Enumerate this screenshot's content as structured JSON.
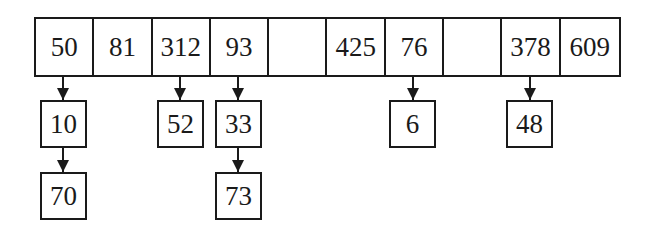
{
  "diagram": {
    "type": "hash-table-separate-chaining",
    "array": [
      "50",
      "81",
      "312",
      "93",
      "",
      "425",
      "76",
      "",
      "378",
      "609"
    ],
    "chains": [
      {
        "slot": 0,
        "nodes": [
          "10",
          "70"
        ]
      },
      {
        "slot": 2,
        "nodes": [
          "52"
        ]
      },
      {
        "slot": 3,
        "nodes": [
          "33",
          "73"
        ]
      },
      {
        "slot": 6,
        "nodes": [
          "6"
        ]
      },
      {
        "slot": 8,
        "nodes": [
          "48"
        ]
      }
    ]
  }
}
